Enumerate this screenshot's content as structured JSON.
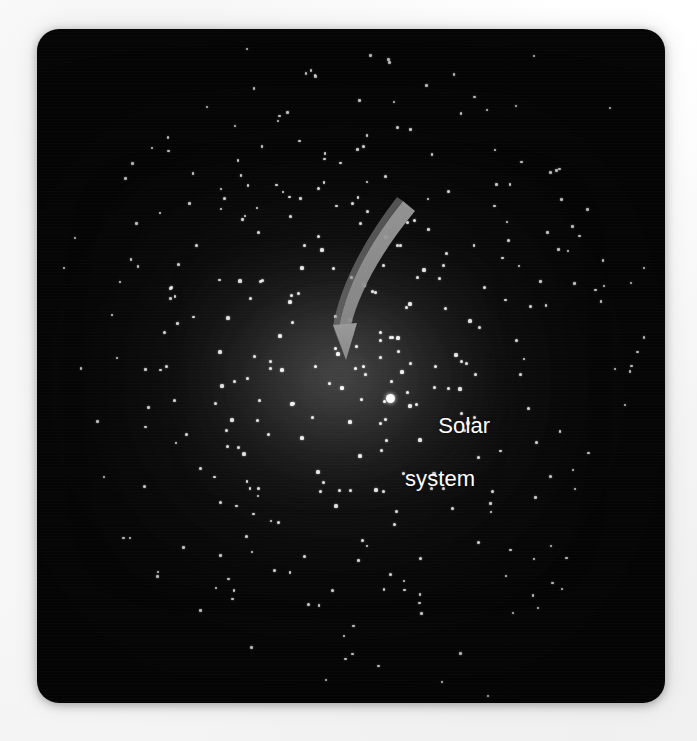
{
  "figure": {
    "kind": "astronomy-illustration",
    "background_color": "#fdfdfd",
    "panel_color": "#050505",
    "star_color": "#fbfbfb",
    "arrow_color": "#8e8e8e",
    "label_color": "#ffffff",
    "glow_color": "#969696"
  },
  "panel": {
    "x": 37,
    "y": 29,
    "width": 628,
    "height": 674,
    "corner_radius": 22
  },
  "annotation": {
    "label_line_1": "Solar",
    "label_line_2": "system",
    "marker_name": "solar-system-marker",
    "marker_x": 353,
    "marker_y": 369,
    "arrow_from": [
      404,
      216
    ],
    "arrow_to": [
      350,
      358
    ]
  },
  "chart_data": {
    "type": "scatter",
    "title": "",
    "xlabel": "",
    "ylabel": "",
    "grid": false,
    "legend": "none",
    "annotations": [
      {
        "text": "Solar system",
        "x": 353,
        "y": 369
      }
    ],
    "series": [
      {
        "name": "stars",
        "marker": "dot",
        "color": "#fbfbfb",
        "points": [
          [
            247,
            49
          ],
          [
            416,
            48
          ],
          [
            534,
            56
          ],
          [
            141,
            104
          ],
          [
            289,
            84
          ],
          [
            369,
            95
          ],
          [
            457,
            78
          ],
          [
            574,
            83
          ],
          [
            206,
            120
          ],
          [
            315,
            113
          ],
          [
            397,
            127
          ],
          [
            487,
            110
          ],
          [
            552,
            119
          ],
          [
            610,
            108
          ],
          [
            152,
            148
          ],
          [
            236,
            141
          ],
          [
            300,
            155
          ],
          [
            363,
            146
          ],
          [
            428,
            159
          ],
          [
            495,
            150
          ],
          [
            560,
            163
          ],
          [
            616,
            145
          ],
          [
            118,
            175
          ],
          [
            186,
            183
          ],
          [
            252,
            170
          ],
          [
            318,
            188
          ],
          [
            385,
            176
          ],
          [
            448,
            191
          ],
          [
            512,
            178
          ],
          [
            578,
            186
          ],
          [
            628,
            176
          ],
          [
            92,
            205
          ],
          [
            160,
            213
          ],
          [
            224,
            198
          ],
          [
            290,
            216
          ],
          [
            352,
            203
          ],
          [
            414,
            220
          ],
          [
            478,
            207
          ],
          [
            540,
            219
          ],
          [
            600,
            205
          ],
          [
            638,
            214
          ],
          [
            75,
            238
          ],
          [
            134,
            229
          ],
          [
            196,
            245
          ],
          [
            258,
            232
          ],
          [
            322,
            250
          ],
          [
            386,
            237
          ],
          [
            446,
            253
          ],
          [
            508,
            240
          ],
          [
            568,
            251
          ],
          [
            622,
            238
          ],
          [
            64,
            268
          ],
          [
            120,
            282
          ],
          [
            178,
            264
          ],
          [
            240,
            281
          ],
          [
            302,
            268
          ],
          [
            364,
            285
          ],
          [
            424,
            270
          ],
          [
            484,
            287
          ],
          [
            544,
            272
          ],
          [
            604,
            286
          ],
          [
            644,
            268
          ],
          [
            58,
            300
          ],
          [
            112,
            315
          ],
          [
            170,
            298
          ],
          [
            228,
            318
          ],
          [
            290,
            302
          ],
          [
            350,
            320
          ],
          [
            410,
            304
          ],
          [
            470,
            321
          ],
          [
            530,
            306
          ],
          [
            590,
            319
          ],
          [
            640,
            302
          ],
          [
            55,
            334
          ],
          [
            106,
            350
          ],
          [
            164,
            332
          ],
          [
            220,
            352
          ],
          [
            280,
            336
          ],
          [
            338,
            354
          ],
          [
            398,
            338
          ],
          [
            456,
            355
          ],
          [
            516,
            340
          ],
          [
            576,
            352
          ],
          [
            634,
            336
          ],
          [
            58,
            368
          ],
          [
            110,
            385
          ],
          [
            166,
            366
          ],
          [
            222,
            386
          ],
          [
            282,
            370
          ],
          [
            342,
            388
          ],
          [
            402,
            372
          ],
          [
            460,
            389
          ],
          [
            520,
            374
          ],
          [
            580,
            386
          ],
          [
            638,
            370
          ],
          [
            64,
            402
          ],
          [
            118,
            418
          ],
          [
            174,
            400
          ],
          [
            232,
            420
          ],
          [
            292,
            404
          ],
          [
            350,
            422
          ],
          [
            410,
            406
          ],
          [
            468,
            423
          ],
          [
            528,
            408
          ],
          [
            586,
            420
          ],
          [
            640,
            404
          ],
          [
            74,
            436
          ],
          [
            128,
            452
          ],
          [
            186,
            434
          ],
          [
            244,
            454
          ],
          [
            302,
            438
          ],
          [
            360,
            456
          ],
          [
            420,
            440
          ],
          [
            478,
            457
          ],
          [
            536,
            442
          ],
          [
            594,
            454
          ],
          [
            88,
            470
          ],
          [
            144,
            486
          ],
          [
            200,
            468
          ],
          [
            258,
            488
          ],
          [
            318,
            472
          ],
          [
            376,
            490
          ],
          [
            434,
            474
          ],
          [
            492,
            491
          ],
          [
            550,
            476
          ],
          [
            606,
            488
          ],
          [
            106,
            504
          ],
          [
            162,
            520
          ],
          [
            220,
            502
          ],
          [
            278,
            522
          ],
          [
            336,
            506
          ],
          [
            394,
            524
          ],
          [
            452,
            508
          ],
          [
            510,
            525
          ],
          [
            568,
            510
          ],
          [
            620,
            522
          ],
          [
            130,
            538
          ],
          [
            188,
            554
          ],
          [
            246,
            536
          ],
          [
            304,
            556
          ],
          [
            362,
            540
          ],
          [
            420,
            558
          ],
          [
            478,
            542
          ],
          [
            534,
            559
          ],
          [
            590,
            544
          ],
          [
            158,
            572
          ],
          [
            216,
            588
          ],
          [
            274,
            570
          ],
          [
            332,
            590
          ],
          [
            390,
            574
          ],
          [
            448,
            592
          ],
          [
            506,
            576
          ],
          [
            562,
            589
          ],
          [
            612,
            574
          ],
          [
            192,
            606
          ],
          [
            250,
            620
          ],
          [
            308,
            604
          ],
          [
            366,
            622
          ],
          [
            424,
            606
          ],
          [
            482,
            623
          ],
          [
            538,
            608
          ],
          [
            592,
            620
          ],
          [
            228,
            638
          ],
          [
            286,
            652
          ],
          [
            344,
            636
          ],
          [
            402,
            654
          ],
          [
            460,
            638
          ],
          [
            518,
            655
          ],
          [
            572,
            640
          ],
          [
            268,
            668
          ],
          [
            326,
            680
          ],
          [
            384,
            666
          ],
          [
            442,
            682
          ],
          [
            500,
            668
          ],
          [
            556,
            679
          ],
          [
            310,
            690
          ],
          [
            370,
            697
          ],
          [
            430,
            688
          ],
          [
            488,
            696
          ]
        ]
      }
    ]
  }
}
